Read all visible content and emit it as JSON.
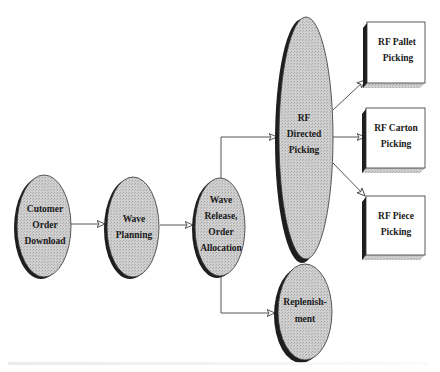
{
  "diagram": {
    "nodes": {
      "customer_order_download": {
        "lines": [
          "Cutomer",
          "Order",
          "Download"
        ],
        "shape": "ellipse"
      },
      "wave_planning": {
        "lines": [
          "Wave",
          "Planning"
        ],
        "shape": "ellipse"
      },
      "wave_release": {
        "lines": [
          "Wave",
          "Release,",
          "Order",
          "Allocation"
        ],
        "shape": "ellipse"
      },
      "rf_directed_picking": {
        "lines": [
          "RF",
          "Directed",
          "Picking"
        ],
        "shape": "ellipse"
      },
      "replenishment": {
        "lines": [
          "Replenish-",
          "ment"
        ],
        "shape": "ellipse"
      },
      "rf_pallet_picking": {
        "lines": [
          "RF Pallet",
          "Picking"
        ],
        "shape": "box"
      },
      "rf_carton_picking": {
        "lines": [
          "RF Carton",
          "Picking"
        ],
        "shape": "box"
      },
      "rf_piece_picking": {
        "lines": [
          "RF Piece",
          "Picking"
        ],
        "shape": "box"
      }
    },
    "edges": [
      {
        "from": "customer_order_download",
        "to": "wave_planning"
      },
      {
        "from": "wave_planning",
        "to": "wave_release"
      },
      {
        "from": "wave_release",
        "to": "rf_directed_picking"
      },
      {
        "from": "wave_release",
        "to": "replenishment"
      },
      {
        "from": "rf_directed_picking",
        "to": "rf_pallet_picking"
      },
      {
        "from": "rf_directed_picking",
        "to": "rf_carton_picking"
      },
      {
        "from": "rf_directed_picking",
        "to": "rf_piece_picking"
      }
    ],
    "colors": {
      "node_fill": "#c9c9c9",
      "node_shadow": "#1e1e1e",
      "box_fill": "#ffffff",
      "edge": "#555555",
      "text": "#1a1a1a"
    }
  }
}
